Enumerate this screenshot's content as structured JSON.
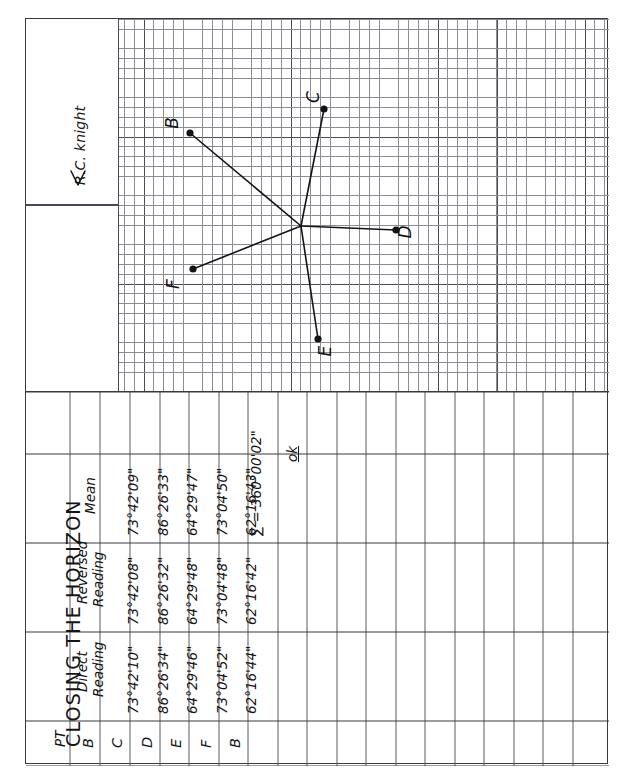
{
  "page": {
    "title": "CLOSING THE HORIZON",
    "date": "NOV 10, 2003",
    "weather": "Cloudy,windy,cool 40°F",
    "observer": "R.C. knight",
    "north_arrow": "←",
    "signature_alt": "R.C. Knight signature"
  },
  "table": {
    "columns": [
      "PT",
      "Direct Reading",
      "Reversed Reading",
      "Mean"
    ],
    "column_labels": {
      "pt": "PT",
      "direct_l1": "Direct",
      "direct_l2": "Reading",
      "reversed_l1": "Reversed",
      "reversed_l2": "Reading",
      "mean": "Mean"
    },
    "rows": [
      {
        "pt": "B",
        "direct": "",
        "reversed": "",
        "mean": ""
      },
      {
        "pt": "C",
        "direct": "73°42'10\"",
        "reversed": "73°42'08\"",
        "mean": "73°42'09\""
      },
      {
        "pt": "D",
        "direct": "86°26'34\"",
        "reversed": "86°26'32\"",
        "mean": "86°26'33\""
      },
      {
        "pt": "E",
        "direct": "64°29'46\"",
        "reversed": "64°29'48\"",
        "mean": "64°29'47\""
      },
      {
        "pt": "F",
        "direct": "73°04'52\"",
        "reversed": "73°04'48\"",
        "mean": "73°04'50\""
      },
      {
        "pt": "B",
        "direct": "62°16'44\"",
        "reversed": "62°16'42\"",
        "mean": "62°16'43\""
      }
    ],
    "sum_label": "∑ = 360°00'02\"",
    "check_note": "ok"
  },
  "sketch": {
    "station_label": "",
    "points": [
      {
        "label": "B",
        "x": 164,
        "y": 114,
        "lx": 152,
        "ly": 104
      },
      {
        "label": "C",
        "x": 298,
        "y": 90,
        "lx": 293,
        "ly": 78
      },
      {
        "label": "D",
        "x": 370,
        "y": 211,
        "lx": 385,
        "ly": 213
      },
      {
        "label": "E",
        "x": 292,
        "y": 320,
        "lx": 305,
        "ly": 332
      },
      {
        "label": "F",
        "x": 167,
        "y": 250,
        "lx": 153,
        "ly": 265
      }
    ],
    "station": {
      "x": 275,
      "y": 207
    }
  },
  "colors": {
    "ink": "#141414",
    "grid_fine": "#8c8c96",
    "grid_heavy": "#4a4a55",
    "border": "#3a3a3a",
    "paper": "#ffffff"
  }
}
